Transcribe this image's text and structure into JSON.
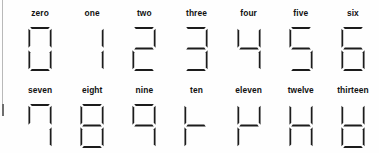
{
  "figure": {
    "type": "diagram",
    "rows": 2,
    "columns": 7,
    "ink_color": "#1c1c1c",
    "background_color": "#ffffff",
    "margin_rule_color": "#b9b9b9"
  },
  "segment_order": [
    "top",
    "top_left",
    "top_right",
    "middle",
    "bottom_left",
    "bottom_right",
    "bottom"
  ],
  "rows": [
    {
      "row_index": 0,
      "cells": [
        {
          "label": "zero",
          "value": 0,
          "segments": {
            "top": true,
            "top_left": true,
            "top_right": true,
            "middle": false,
            "bottom_left": true,
            "bottom_right": true,
            "bottom": true
          }
        },
        {
          "label": "one",
          "value": 1,
          "segments": {
            "top": false,
            "top_left": false,
            "top_right": true,
            "middle": false,
            "bottom_left": false,
            "bottom_right": true,
            "bottom": false
          }
        },
        {
          "label": "two",
          "value": 2,
          "segments": {
            "top": true,
            "top_left": false,
            "top_right": true,
            "middle": true,
            "bottom_left": true,
            "bottom_right": false,
            "bottom": true
          }
        },
        {
          "label": "three",
          "value": 3,
          "segments": {
            "top": true,
            "top_left": false,
            "top_right": true,
            "middle": true,
            "bottom_left": false,
            "bottom_right": true,
            "bottom": true
          }
        },
        {
          "label": "four",
          "value": 4,
          "segments": {
            "top": false,
            "top_left": true,
            "top_right": true,
            "middle": true,
            "bottom_left": false,
            "bottom_right": true,
            "bottom": false
          }
        },
        {
          "label": "five",
          "value": 5,
          "segments": {
            "top": true,
            "top_left": true,
            "top_right": false,
            "middle": true,
            "bottom_left": false,
            "bottom_right": true,
            "bottom": true
          }
        },
        {
          "label": "six",
          "value": 6,
          "segments": {
            "top": true,
            "top_left": true,
            "top_right": false,
            "middle": true,
            "bottom_left": true,
            "bottom_right": true,
            "bottom": true
          }
        }
      ]
    },
    {
      "row_index": 1,
      "cells": [
        {
          "label": "seven",
          "value": 7,
          "segments": {
            "top": true,
            "top_left": true,
            "top_right": true,
            "middle": false,
            "bottom_left": false,
            "bottom_right": true,
            "bottom": false
          }
        },
        {
          "label": "eight",
          "value": 8,
          "segments": {
            "top": true,
            "top_left": true,
            "top_right": true,
            "middle": true,
            "bottom_left": true,
            "bottom_right": true,
            "bottom": true
          }
        },
        {
          "label": "nine",
          "value": 9,
          "segments": {
            "top": true,
            "top_left": true,
            "top_right": true,
            "middle": true,
            "bottom_left": false,
            "bottom_right": true,
            "bottom": false
          }
        },
        {
          "label": "ten",
          "value": 10,
          "segments": {
            "top": false,
            "top_left": true,
            "top_right": false,
            "middle": true,
            "bottom_left": true,
            "bottom_right": false,
            "bottom": false
          }
        },
        {
          "label": "eleven",
          "value": 11,
          "segments": {
            "top": false,
            "top_left": true,
            "top_right": true,
            "middle": true,
            "bottom_left": true,
            "bottom_right": false,
            "bottom": false
          }
        },
        {
          "label": "twelve",
          "value": 12,
          "segments": {
            "top": false,
            "top_left": true,
            "top_right": true,
            "middle": true,
            "bottom_left": true,
            "bottom_right": true,
            "bottom": false
          }
        },
        {
          "label": "thirteen",
          "value": 13,
          "segments": {
            "top": false,
            "top_left": true,
            "top_right": true,
            "middle": true,
            "bottom_left": true,
            "bottom_right": true,
            "bottom": true
          }
        }
      ]
    }
  ]
}
